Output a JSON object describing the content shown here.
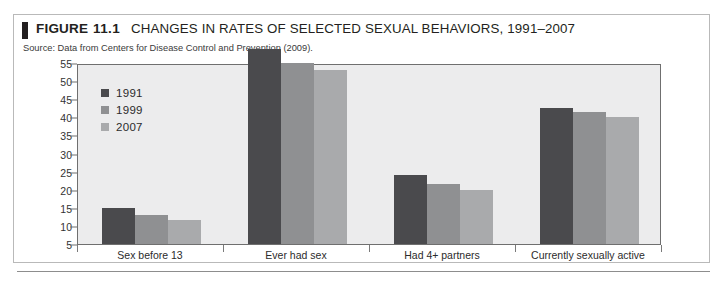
{
  "figure": {
    "tab_icon": "black-bar-marker",
    "label": "FIGURE",
    "number": "11.1",
    "title": "CHANGES IN RATES OF SELECTED SEXUAL BEHAVIORS, 1991–2007",
    "source": "Source: Data from Centers for Disease Control and Prevention (2009)."
  },
  "colors": {
    "series_1991": "#4a4a4d",
    "series_1999": "#8f9092",
    "series_2007": "#a9aaac",
    "plot_background": "#ececed",
    "axis": "#6f6f6f",
    "text": "#231f20"
  },
  "chart_data": {
    "type": "bar",
    "title": "CHANGES IN RATES OF SELECTED SEXUAL BEHAVIORS, 1991–2007",
    "subtitle": "",
    "xlabel": "",
    "ylabel": "",
    "categories": [
      "Sex before 13",
      "Ever had sex",
      "Had 4+ partners",
      "Currently sexually active"
    ],
    "series": [
      {
        "name": "1991",
        "color": "#4a4a4d",
        "values": [
          10,
          54,
          19,
          37.5
        ]
      },
      {
        "name": "1999",
        "color": "#8f9092",
        "values": [
          8,
          50,
          16.5,
          36.5
        ]
      },
      {
        "name": "2007",
        "color": "#a9aaac",
        "values": [
          6.5,
          48,
          15,
          35
        ]
      }
    ],
    "ylim": [
      0,
      55
    ],
    "yticks": [
      55,
      50,
      45,
      40,
      35,
      30,
      25,
      20,
      15,
      10,
      5
    ],
    "ytick_labels": [
      "55",
      "50",
      "45",
      "40",
      "35",
      "30",
      "25",
      "20",
      "15",
      "10",
      "5"
    ],
    "grid": false,
    "legend_position": "inside-top-left"
  }
}
